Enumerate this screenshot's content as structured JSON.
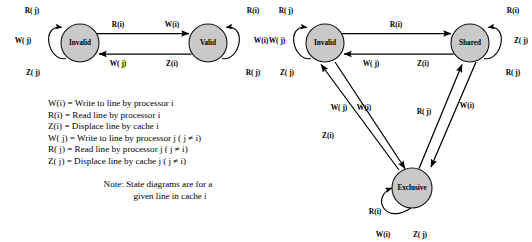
{
  "figure": {
    "note_lines": [
      "Note: State diagrams are for a",
      "given line in cache i"
    ],
    "colors": {
      "node_fill": "#c9c9c9",
      "stroke": "#111111",
      "background": "#ffffff",
      "text": "#000000"
    }
  },
  "legend": {
    "entries": [
      {
        "symbol": "W(i)",
        "equals": "=",
        "description": "Write to line by processor i"
      },
      {
        "symbol": "R(i)",
        "equals": "=",
        "description": "Read line by processor i"
      },
      {
        "symbol": "Z(i)",
        "equals": "=",
        "description": "Displace line by cache i"
      },
      {
        "symbol": "W( j)",
        "equals": "=",
        "description": "Write to line by processor j ( j ≠ i)"
      },
      {
        "symbol": "R( j)",
        "equals": "=",
        "description": "Read line by processor j ( j ≠ i)"
      },
      {
        "symbol": "Z( j)",
        "equals": "=",
        "description": "Displace line by cache j ( j ≠ i)"
      }
    ],
    "full_lines": [
      "W(i) = Write to line by processor i",
      "R(i)  = Read line by processor i",
      "Z(i)  = Displace line by cache i",
      "W( j) = Write to line by processor j ( j ≠ i)",
      "R( j) = Read line by processor j ( j ≠ i)",
      "Z( j) = Displace line by cache j ( j ≠ i)"
    ]
  },
  "left_diagram": {
    "name": "write-through-state-diagram",
    "states": [
      {
        "id": "invalid",
        "label": "Invalid",
        "cx": 80,
        "cy": 43,
        "r": 19
      },
      {
        "id": "valid",
        "label": "Valid",
        "cx": 208,
        "cy": 43,
        "r": 19
      }
    ],
    "transitions": [
      {
        "id": "invalid-to-valid",
        "from": "Invalid",
        "to": "Valid",
        "labels": [
          "R(i)",
          "W(i)"
        ]
      },
      {
        "id": "valid-to-invalid",
        "from": "Valid",
        "to": "Invalid",
        "labels": [
          "W( j)",
          "Z(i)"
        ]
      }
    ],
    "self_loops": [
      {
        "id": "invalid-loop",
        "state": "Invalid",
        "labels": [
          "R( j)",
          "W( j)",
          "Z( j)"
        ]
      },
      {
        "id": "valid-loop",
        "state": "Valid",
        "labels": [
          "R(i)",
          "W(i)",
          "R( j)"
        ]
      }
    ]
  },
  "right_diagram": {
    "name": "write-back-mesi-state-diagram",
    "states": [
      {
        "id": "invalid",
        "label": "Invalid",
        "cx": 325,
        "cy": 43,
        "r": 19
      },
      {
        "id": "shared",
        "label": "Shared",
        "cx": 470,
        "cy": 43,
        "r": 19
      },
      {
        "id": "exclusive",
        "label": "Exclusive",
        "cx": 412,
        "cy": 188,
        "r": 20
      }
    ],
    "transitions": [
      {
        "id": "invalid-to-shared",
        "from": "Invalid",
        "to": "Shared",
        "labels": [
          "R(i)",
          "W(i)"
        ]
      },
      {
        "id": "shared-to-invalid",
        "from": "Shared",
        "to": "Invalid",
        "labels": [
          "W( j)",
          "Z(i)"
        ]
      },
      {
        "id": "exclusive-to-invalid",
        "from": "Exclusive",
        "to": "Invalid",
        "labels": [
          "W( j)",
          "Z(i)"
        ]
      },
      {
        "id": "invalid-to-exclusive",
        "from": "Invalid",
        "to": "Exclusive",
        "labels": [
          "W(i)"
        ]
      },
      {
        "id": "exclusive-to-shared",
        "from": "Exclusive",
        "to": "Shared",
        "labels": [
          "R( j)"
        ]
      },
      {
        "id": "shared-to-exclusive",
        "from": "Shared",
        "to": "Exclusive",
        "labels": [
          "W(i)"
        ]
      }
    ],
    "self_loops": [
      {
        "id": "invalid-loop",
        "state": "Invalid",
        "labels": [
          "R( j)",
          "W( j)",
          "Z( j)"
        ]
      },
      {
        "id": "shared-loop",
        "state": "Shared",
        "labels": [
          "R(i)",
          "Z( j)",
          "R( j)"
        ]
      },
      {
        "id": "exclusive-loop",
        "state": "Exclusive",
        "labels": [
          "R(i)",
          "W(i)",
          "Z( j)"
        ]
      }
    ]
  },
  "labels": {
    "left": {
      "inv_loop_top": "R( j)",
      "inv_loop_mid": "W( j)",
      "inv_loop_bot": "Z( j)",
      "top_edge_a": "R(i)",
      "top_edge_b": "W(i)",
      "bot_edge_a": "W( j)",
      "bot_edge_b": "Z(i)",
      "val_loop_top": "R(i)",
      "val_loop_mid": "W(i)",
      "val_loop_bot": "R( j)"
    },
    "right": {
      "inv_loop_top": "R( j)",
      "inv_loop_mid": "W( j)",
      "inv_loop_bot": "Z( j)",
      "top_edge_a": "R(i)",
      "bot_edge_a": "W( j)",
      "bot_edge_b": "Z(i)",
      "sh_loop_top": "R(i)",
      "sh_loop_mid": "Z( j)",
      "sh_loop_bot": "R( j)",
      "diag_wj": "W( j)",
      "diag_zi": "Z(i)",
      "diag_wi_left": "W(i)",
      "diag_rj": "R( j)",
      "diag_wi_right": "W(i)",
      "ex_loop_top": "R(i)",
      "ex_loop_left": "W(i)",
      "ex_loop_right": "Z( j)"
    }
  }
}
